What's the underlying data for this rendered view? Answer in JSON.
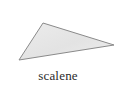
{
  "figure": {
    "name": "scalene-triangle-figure",
    "background_color": "#ffffff",
    "caption": "scalene",
    "caption_color": "#2b2b2b"
  },
  "shape": {
    "kind": "triangle",
    "semantic_name": "scalene-triangle",
    "fill_color": "#e4e4e4",
    "stroke_color": "#8a8a8a",
    "stroke_width": 1,
    "vertices": [
      {
        "label": "apex-top",
        "x": 43,
        "y": 23
      },
      {
        "label": "vertex-bottom-left",
        "x": 19,
        "y": 60
      },
      {
        "label": "vertex-right",
        "x": 114,
        "y": 45
      }
    ],
    "points_attr": "43,23 19,60 114,45"
  }
}
